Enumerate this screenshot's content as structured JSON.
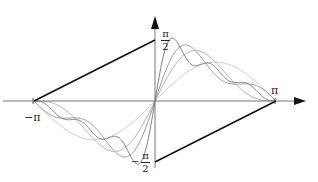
{
  "chart_data": {
    "type": "line",
    "title": "",
    "target_function": "x/2",
    "x_ticks": [
      "-π",
      "π"
    ],
    "y_ticks": [
      "π/2",
      "-π/2"
    ],
    "xlim": [
      -3.14159,
      3.14159
    ],
    "ylim": [
      -1.5708,
      1.5708
    ],
    "series": [
      {
        "name": "target",
        "color": "#111111",
        "terms": 0
      },
      {
        "name": "S1",
        "color": "#c8c8c8",
        "terms": 1
      },
      {
        "name": "S2",
        "color": "#b0b0b0",
        "terms": 2
      },
      {
        "name": "S3",
        "color": "#999999",
        "terms": 3
      },
      {
        "name": "S6",
        "color": "#808080",
        "terms": 6
      }
    ]
  },
  "labels": {
    "x_neg": "−π",
    "x_pos": "π",
    "y_pos_num": "π",
    "y_pos_den": "2",
    "y_neg_sign": "−",
    "y_neg_num": "π",
    "y_neg_den": "2"
  }
}
